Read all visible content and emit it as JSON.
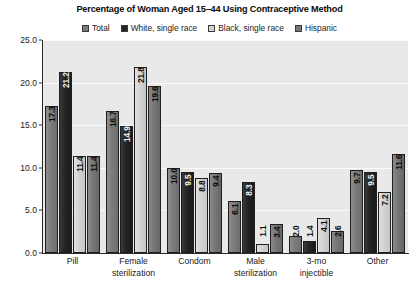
{
  "chart_data": {
    "type": "bar",
    "title": "Percentage of Woman Aged 15–44 Using Contraceptive Method",
    "xlabel": "",
    "ylabel": "",
    "ylim": [
      0,
      25
    ],
    "yticks": [
      "0.0",
      "5.0",
      "10.0",
      "15.0",
      "20.0",
      "25.0"
    ],
    "ytick_values": [
      0,
      5,
      10,
      15,
      20,
      25
    ],
    "grid": true,
    "legend_position": "top-center",
    "categories": [
      "Pill",
      "Female sterilization",
      "Condom",
      "Male sterilization",
      "3-mo injectible",
      "Other"
    ],
    "category_lines": [
      [
        "Pill",
        ""
      ],
      [
        "Female",
        "sterilization"
      ],
      [
        "Condom",
        ""
      ],
      [
        "Male",
        "sterilization"
      ],
      [
        "3-mo",
        "injectible"
      ],
      [
        "Other",
        ""
      ]
    ],
    "series": [
      {
        "name": "Total",
        "color": "#7b7b7b",
        "values": [
          17.3,
          16.7,
          10.0,
          6.1,
          2.0,
          9.7
        ],
        "labels": [
          "17.3",
          "16.7",
          "10.0",
          "6.1",
          "2.0",
          "9.7"
        ]
      },
      {
        "name": "White, single race",
        "color": "#232323",
        "values": [
          21.2,
          14.9,
          9.5,
          8.3,
          1.4,
          9.5
        ],
        "labels": [
          "21.2",
          "14.9",
          "9.5",
          "8.3",
          "1.4",
          "9.5"
        ]
      },
      {
        "name": "Black, single race",
        "color": "#d2d2d2",
        "values": [
          11.4,
          21.8,
          8.8,
          1.1,
          4.1,
          7.2
        ],
        "labels": [
          "11.4",
          "21.8",
          "8.8",
          "1.1",
          "4.1",
          "7.2"
        ]
      },
      {
        "name": "Hispanic",
        "color": "#767676",
        "values": [
          11.4,
          19.6,
          9.4,
          3.4,
          2.6,
          11.6
        ],
        "labels": [
          "11.4",
          "19.6",
          "9.4",
          "3.4",
          "2.6",
          "11.6"
        ]
      }
    ]
  }
}
